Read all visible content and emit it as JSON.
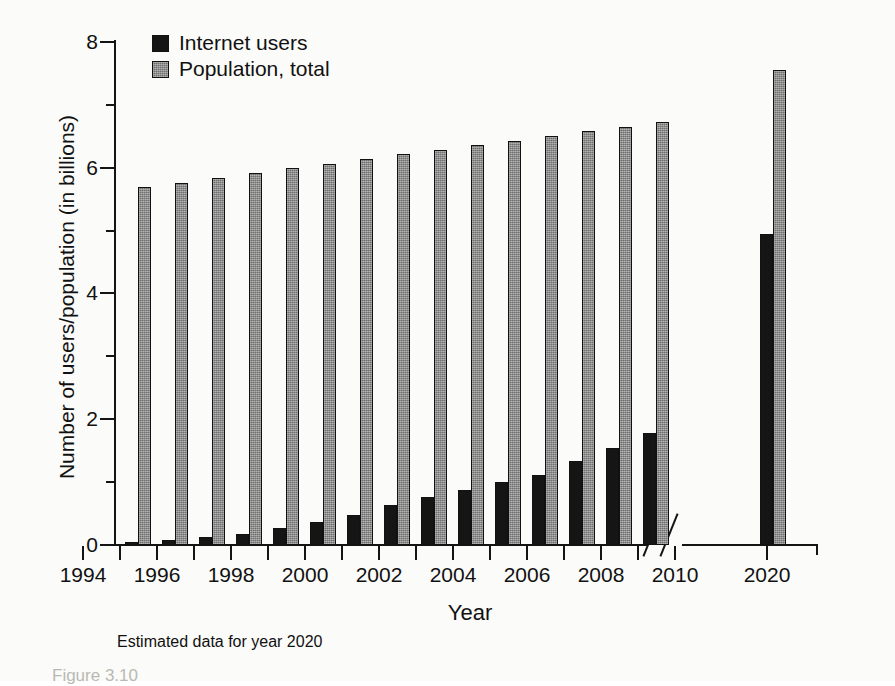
{
  "figure": {
    "caption": "Figure 3.10",
    "footnote": "Estimated data for year 2020"
  },
  "axes": {
    "ylabel": "Number of users/population (in billions)",
    "xlabel": "Year",
    "y_major_ticks": [
      "0",
      "2",
      "4",
      "6",
      "8"
    ],
    "y_minor_ticks": [
      "1",
      "3",
      "5",
      "7"
    ],
    "x_tick_labels": [
      "1994",
      "1996",
      "1998",
      "2000",
      "2002",
      "2004",
      "2006",
      "2008",
      "2010",
      "2020"
    ],
    "axis_break": "broken-axis-marker"
  },
  "legend": {
    "entries": [
      {
        "label": "Internet users",
        "swatch": "black-solid",
        "color": "#151515"
      },
      {
        "label": "Population, total",
        "swatch": "gray-hatched",
        "color": "#6e6e6e"
      }
    ]
  },
  "chart_data": {
    "type": "bar",
    "title": "",
    "subtitle": "",
    "xlabel": "Year",
    "ylabel": "Number of users/population (in billions)",
    "ylim": [
      0,
      8
    ],
    "y_ticks": [
      0,
      2,
      4,
      6,
      8
    ],
    "y_minor_ticks": [
      1,
      3,
      5,
      7
    ],
    "grid": false,
    "legend_position": "top-left",
    "axis_break": {
      "between": [
        2010,
        2020
      ],
      "style": "double-slash"
    },
    "note": "Estimated data for year 2020",
    "categories": [
      1995,
      1996,
      1997,
      1998,
      1999,
      2000,
      2001,
      2002,
      2003,
      2004,
      2005,
      2006,
      2007,
      2008,
      2009,
      2020
    ],
    "series": [
      {
        "name": "Internet users",
        "color": "#151515",
        "values": [
          0.04,
          0.08,
          0.12,
          0.18,
          0.27,
          0.36,
          0.47,
          0.64,
          0.76,
          0.87,
          1.0,
          1.12,
          1.33,
          1.55,
          1.78,
          4.95
        ]
      },
      {
        "name": "Population, total",
        "color": "#6e6e6e",
        "values": [
          5.69,
          5.76,
          5.84,
          5.92,
          5.99,
          6.06,
          6.14,
          6.21,
          6.28,
          6.36,
          6.43,
          6.5,
          6.58,
          6.65,
          6.72,
          7.55
        ]
      }
    ]
  },
  "render": {
    "plot": {
      "baseline_y": 545,
      "value_px_per_unit": 62.9,
      "bar_width": 13,
      "group_pitch": 37,
      "first_group_left": 125,
      "break_group_left": 760
    }
  }
}
